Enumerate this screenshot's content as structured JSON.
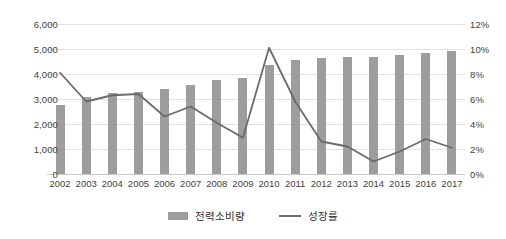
{
  "chart_data": {
    "type": "bar",
    "title": "",
    "subtitle": "",
    "xlabel": "",
    "ylabel": "",
    "grid": true,
    "legend_position": "bottom",
    "categories": [
      "2002",
      "2003",
      "2004",
      "2005",
      "2006",
      "2007",
      "2008",
      "2009",
      "2010",
      "2011",
      "2012",
      "2013",
      "2014",
      "2015",
      "2016",
      "2017"
    ],
    "axes": {
      "left": {
        "label": "",
        "ylim": [
          0,
          6000
        ],
        "ticks": [
          0,
          1000,
          2000,
          3000,
          4000,
          5000,
          6000
        ],
        "ticklabels": [
          "0",
          "1,000",
          "2,000",
          "3,000",
          "4,000",
          "5,000",
          "6,000"
        ]
      },
      "right": {
        "label": "",
        "ylim": [
          0,
          12
        ],
        "ticks": [
          0,
          2,
          4,
          6,
          8,
          10,
          12
        ],
        "ticklabels": [
          "0%",
          "2%",
          "4%",
          "6%",
          "8%",
          "10%",
          "12%"
        ]
      }
    },
    "series": [
      {
        "name": "전력소비량",
        "type": "bar",
        "axis": "left",
        "color": "#9d9d9d",
        "values": [
          2780,
          3080,
          3250,
          3300,
          3420,
          3560,
          3760,
          3840,
          4380,
          4560,
          4640,
          4700,
          4700,
          4780,
          4860,
          4920
        ]
      },
      {
        "name": "성장률",
        "type": "line",
        "axis": "right",
        "color": "#6b6b6b",
        "values": [
          8.1,
          5.8,
          6.3,
          6.4,
          4.6,
          5.4,
          4.1,
          2.9,
          10.1,
          5.8,
          2.6,
          2.2,
          1.0,
          1.8,
          2.8,
          2.1
        ]
      }
    ],
    "legend": [
      {
        "label": "전력소비량",
        "marker": "bar-swatch",
        "color": "#9d9d9d"
      },
      {
        "label": "성장률",
        "marker": "line-swatch",
        "color": "#6b6b6b"
      }
    ]
  }
}
